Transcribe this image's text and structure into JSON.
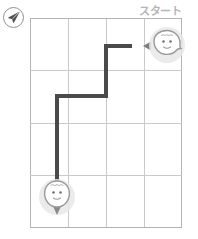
{
  "app": {
    "title": "Route Grid Puzzle",
    "background_color": "#ffffff"
  },
  "compass": {
    "icon": "paper-plane-icon",
    "label": ""
  },
  "labels": {
    "start_text": "スタート"
  },
  "colors": {
    "grid_line": "#c9c9c9",
    "grid_edge": "#b3b3b3",
    "route": "#4a4a4a",
    "marker_halo": "#e8e8e8",
    "marker_outline": "#9a9a9a",
    "label_text": "#b5b5b5",
    "background": "#ffffff"
  },
  "board": {
    "columns": 4,
    "rows": 4,
    "cell_width": 38,
    "cell_height": 52.5,
    "origin_x": 30,
    "origin_y": 18
  },
  "markers": [
    {
      "id": "start",
      "name": "start-marker",
      "face": "smiley-face",
      "tail_direction": "left",
      "cell": "col4-row1"
    },
    {
      "id": "goal",
      "name": "goal-marker",
      "face": "smiley-face",
      "tail_direction": "down",
      "cell": "col1-row4"
    }
  ],
  "route": {
    "stroke_width": 4,
    "points": [
      [
        132,
        46
      ],
      [
        106,
        46
      ],
      [
        106,
        96
      ],
      [
        57,
        96
      ],
      [
        57,
        190
      ]
    ]
  },
  "arrow": {
    "name": "direction-arrow-icon",
    "direction": "left",
    "x": 140,
    "y": 46
  }
}
